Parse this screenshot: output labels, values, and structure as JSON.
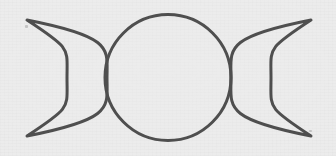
{
  "image": {
    "title": "Triple Moon Symbol",
    "subject": "triple-goddess-symbol",
    "width": 336,
    "height": 156,
    "background_color": "#ececec",
    "stroke_color": "#4f4f4f",
    "stroke_width": 3,
    "fill": "none",
    "medium": "hand-drawn line art on light grey paper"
  },
  "shapes": {
    "left_crescent": {
      "name": "waxing-crescent",
      "phase_label": "Waxing Crescent",
      "outer_arc": {
        "start_x": 27,
        "start_y": 20,
        "end_x": 27,
        "end_y": 136,
        "radius_x": 41,
        "radius_y": 60,
        "bulge_x": 107
      },
      "inner_arc": {
        "radius_x": 21,
        "radius_y": 58,
        "bulge_x": 67
      },
      "tip_top": [
        27,
        20
      ],
      "tip_bottom": [
        27,
        136
      ]
    },
    "center_circle": {
      "name": "full-moon",
      "phase_label": "Full Moon",
      "center_x": 168,
      "center_y": 77.5,
      "radius": 63
    },
    "right_crescent": {
      "name": "waning-crescent",
      "phase_label": "Waning Crescent",
      "outer_arc": {
        "start_x": 311,
        "start_y": 20,
        "end_x": 311,
        "end_y": 136,
        "radius_x": 41,
        "radius_y": 60,
        "bulge_x": 231
      },
      "inner_arc": {
        "radius_x": 21,
        "radius_y": 58,
        "bulge_x": 271
      },
      "tip_top": [
        311,
        20
      ],
      "tip_bottom": [
        311,
        136
      ]
    }
  },
  "specks": [
    {
      "x": 25,
      "y": 25,
      "w": 3,
      "h": 3
    },
    {
      "x": 309,
      "y": 130,
      "w": 3,
      "h": 2
    }
  ]
}
